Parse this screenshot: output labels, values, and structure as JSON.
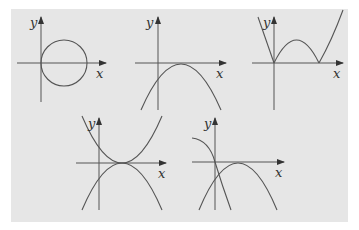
{
  "figure": {
    "background_color": "#e6e6e6",
    "line_color": "#555555",
    "graphs": [
      {
        "id": 1,
        "description": "circle tangent to y-axis, centered on positive x-axis",
        "x_label": "x",
        "y_label": "y"
      },
      {
        "id": 2,
        "description": "downward parabola through origin, positive second root",
        "x_label": "x",
        "y_label": "y"
      },
      {
        "id": 3,
        "description": "absolute value of parabola (W shape) with roots at origin and positive x",
        "x_label": "x",
        "y_label": "y"
      },
      {
        "id": 4,
        "description": "upward and downward parabolas sharing roots at origin and positive x",
        "x_label": "x",
        "y_label": "y"
      },
      {
        "id": 5,
        "description": "two downward parabolas through origin, mirrored about y-axis",
        "x_label": "x",
        "y_label": "y"
      }
    ]
  }
}
